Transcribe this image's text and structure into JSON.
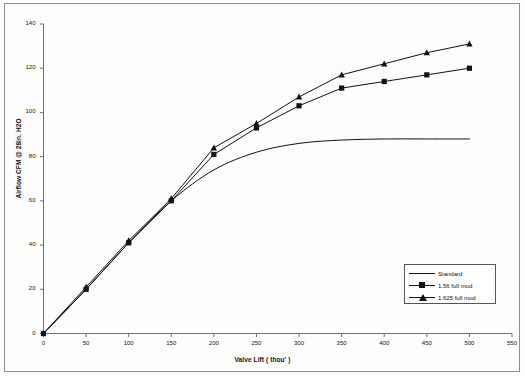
{
  "chart_data": {
    "type": "line",
    "title": "",
    "xlabel": "Valve Lift ( thou' )",
    "ylabel": "Airflow CFM @ 28in. H2O",
    "xlim": [
      0,
      550
    ],
    "ylim": [
      0,
      140
    ],
    "xticks": [
      0,
      50,
      100,
      150,
      200,
      250,
      300,
      350,
      400,
      450,
      500,
      550
    ],
    "yticks": [
      0,
      20,
      40,
      60,
      80,
      100,
      120,
      140
    ],
    "grid": false,
    "legend_position": "lower-right",
    "x": [
      0,
      50,
      100,
      150,
      200,
      250,
      300,
      350,
      400,
      450,
      500
    ],
    "series": [
      {
        "name": "Standard",
        "marker": "none",
        "color": "#111111",
        "values": [
          0,
          20,
          41,
          60,
          74,
          82,
          86,
          87.5,
          88,
          88,
          88
        ]
      },
      {
        "name": "1.56 full mod",
        "marker": "square",
        "color": "#111111",
        "values": [
          0,
          20,
          41,
          60,
          81,
          93,
          103,
          111,
          114,
          117,
          120
        ]
      },
      {
        "name": "1.625 full mod",
        "marker": "triangle",
        "color": "#111111",
        "values": [
          0,
          21,
          42,
          61,
          84,
          95,
          107,
          117,
          122,
          127,
          131
        ]
      }
    ]
  },
  "axes": {
    "y_title": "Airflow CFM @ 28in. H2O",
    "x_title": "Valve Lift ( thou' )",
    "y_tick_labels": [
      "0",
      "20",
      "40",
      "60",
      "80",
      "100",
      "120",
      "140"
    ],
    "x_tick_labels": [
      "0",
      "50",
      "100",
      "150",
      "200",
      "250",
      "300",
      "350",
      "400",
      "450",
      "500",
      "550"
    ]
  },
  "legend": {
    "entries": [
      {
        "label": "Standard",
        "marker": "line"
      },
      {
        "label": "1.56 full mod",
        "marker": "square"
      },
      {
        "label": "1.625 full mod",
        "marker": "triangle"
      }
    ]
  },
  "colors": {
    "ink": "#111111",
    "axis": "#6f6f6f",
    "border": "#8e8e8e",
    "background": "#fdfdfd"
  }
}
